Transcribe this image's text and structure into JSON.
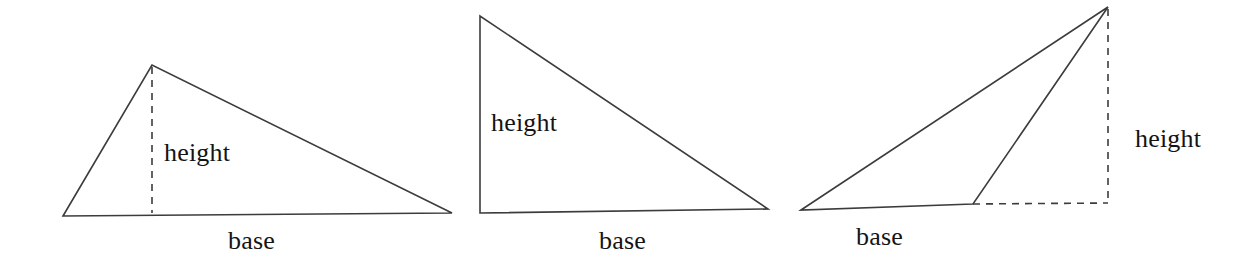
{
  "figure": {
    "background_color": "#ffffff",
    "line_color": "#3c3c3c",
    "text_color": "#141414",
    "width": 1254,
    "height": 263,
    "triangles": [
      {
        "id": "acute-triangle",
        "name": "Triangle with interior height",
        "height_label": "height",
        "base_label": "base",
        "height_line_style": "dashed",
        "height_position": "interior",
        "vertices": [
          [
            63,
            216
          ],
          [
            152,
            65
          ],
          [
            452,
            213
          ]
        ],
        "height_foot": [
          152,
          213
        ]
      },
      {
        "id": "right-triangle",
        "name": "Right triangle with height as a side",
        "height_label": "height",
        "base_label": "base",
        "height_line_style": "solid",
        "height_position": "side",
        "vertices": [
          [
            480,
            16
          ],
          [
            480,
            213
          ],
          [
            768,
            209
          ]
        ],
        "height_foot": [
          480,
          213
        ]
      },
      {
        "id": "obtuse-triangle",
        "name": "Obtuse triangle with exterior height",
        "height_label": "height",
        "base_label": "base",
        "height_line_style": "dashed",
        "height_position": "exterior",
        "vertices": [
          [
            801,
            210
          ],
          [
            1108,
            7
          ],
          [
            973,
            204
          ]
        ],
        "height_foot": [
          1108,
          203
        ],
        "base_extension": [
          [
            973,
            204
          ],
          [
            1108,
            203
          ]
        ]
      }
    ],
    "labels": [
      {
        "key": "h1",
        "text": "height",
        "for": "acute-triangle",
        "kind": "height"
      },
      {
        "key": "b1",
        "text": "base",
        "for": "acute-triangle",
        "kind": "base"
      },
      {
        "key": "h2",
        "text": "height",
        "for": "right-triangle",
        "kind": "height"
      },
      {
        "key": "b2",
        "text": "base",
        "for": "right-triangle",
        "kind": "base"
      },
      {
        "key": "b3",
        "text": "base",
        "for": "obtuse-triangle",
        "kind": "base"
      },
      {
        "key": "h3",
        "text": "height",
        "for": "obtuse-triangle",
        "kind": "height"
      }
    ]
  }
}
